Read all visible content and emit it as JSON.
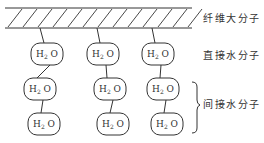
{
  "diagram": {
    "labels": {
      "fiber": "纤维大分子",
      "direct": "直接水分子",
      "indirect": "间接水分子"
    },
    "molecule": {
      "base": "H",
      "subscript": "2",
      "rest": "O"
    },
    "columns": [
      {
        "anchor_x": 40,
        "boxes": [
          {
            "cx": 47,
            "cy": 54
          },
          {
            "cx": 40,
            "cy": 89
          },
          {
            "cx": 44,
            "cy": 124
          }
        ]
      },
      {
        "anchor_x": 97,
        "boxes": [
          {
            "cx": 103,
            "cy": 54
          },
          {
            "cx": 110,
            "cy": 89
          },
          {
            "cx": 113,
            "cy": 124
          }
        ]
      },
      {
        "anchor_x": 152,
        "boxes": [
          {
            "cx": 158,
            "cy": 54
          },
          {
            "cx": 163,
            "cy": 89
          },
          {
            "cx": 167,
            "cy": 124
          }
        ]
      }
    ],
    "colors": {
      "line": "#333333",
      "background": "#ffffff"
    }
  }
}
